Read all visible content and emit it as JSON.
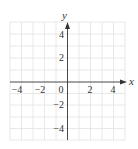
{
  "diagram": {
    "type": "coordinate-grid",
    "x_axis": {
      "label": "x",
      "range": [
        -5,
        5
      ],
      "tick_labels": [
        "−4",
        "−2",
        "0",
        "2",
        "4"
      ]
    },
    "y_axis": {
      "label": "y",
      "range": [
        -5,
        5
      ],
      "tick_labels": [
        "4",
        "2",
        "−2",
        "−4"
      ]
    },
    "grid": {
      "cells_x": 10,
      "cells_y": 10,
      "color": "#e2e2e2"
    },
    "axis_color": "#333333"
  }
}
